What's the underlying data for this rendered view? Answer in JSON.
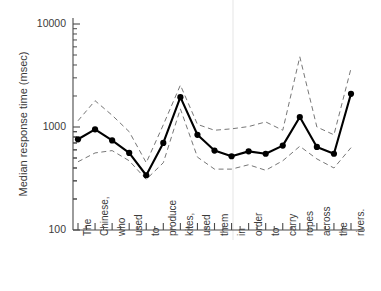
{
  "chart_data": {
    "type": "line",
    "title": "",
    "xlabel": "",
    "ylabel": "Median response time (msec)",
    "yscale": "log",
    "ylim": [
      100,
      10000
    ],
    "ytick_labels": [
      "10000",
      "1000",
      "100"
    ],
    "ytick_values": [
      10000,
      1000,
      100
    ],
    "grid": false,
    "legend": "none",
    "categories": [
      "The",
      "Chinese,",
      "who",
      "used",
      "to",
      "produce",
      "kites,",
      "used",
      "them",
      "in",
      "order",
      "to",
      "carry",
      "ropes",
      "across",
      "the",
      "rivers."
    ],
    "series": [
      {
        "name": "median",
        "style": "solid-with-markers",
        "values": [
          760,
          950,
          740,
          560,
          340,
          700,
          1950,
          840,
          590,
          520,
          580,
          550,
          660,
          1250,
          640,
          550,
          2100
        ]
      },
      {
        "name": "upper quartile",
        "style": "dashed",
        "values": [
          1150,
          1800,
          1300,
          900,
          450,
          1050,
          2550,
          1060,
          930,
          960,
          1010,
          1120,
          930,
          4800,
          1000,
          840,
          3700
        ]
      },
      {
        "name": "lower quartile",
        "style": "dashed",
        "values": [
          460,
          560,
          590,
          470,
          310,
          450,
          1500,
          510,
          390,
          390,
          430,
          380,
          470,
          650,
          490,
          400,
          630
        ]
      }
    ],
    "annotations": []
  },
  "axes": {
    "y_axis_title": "Median response time (msec)",
    "y_labels": [
      "10000",
      "1000",
      "100"
    ],
    "x_labels": [
      "The",
      "Chinese,",
      "who",
      "used",
      "to",
      "produce",
      "kites,",
      "used",
      "them",
      "in",
      "order",
      "to",
      "carry",
      "ropes",
      "across",
      "the",
      "rivers."
    ]
  },
  "colors": {
    "line": "#000000",
    "dashed": "#777777",
    "axis": "#4a4a4a",
    "text": "#3b3b3b",
    "background": "#ffffff"
  }
}
